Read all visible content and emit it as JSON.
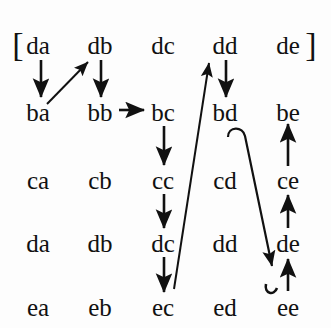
{
  "figure": {
    "background_color": "#fdfdfd",
    "ink_color": "#111111",
    "bracket_open": "[",
    "bracket_close": "]",
    "rows": [
      {
        "row_id": "d-top",
        "cells": [
          "da",
          "db",
          "dc",
          "dd",
          "de"
        ]
      },
      {
        "row_id": "b",
        "cells": [
          "ba",
          "bb",
          "bc",
          "bd",
          "be"
        ]
      },
      {
        "row_id": "c",
        "cells": [
          "ca",
          "cb",
          "cc",
          "cd",
          "ce"
        ]
      },
      {
        "row_id": "d-lower",
        "cells": [
          "da",
          "db",
          "dc",
          "dd",
          "de"
        ]
      },
      {
        "row_id": "e",
        "cells": [
          "ea",
          "eb",
          "ec",
          "ed",
          "ee"
        ]
      }
    ],
    "grid": {
      "column_x": [
        38,
        100,
        163,
        225,
        288
      ],
      "row_y": [
        45,
        112,
        180,
        243,
        307
      ]
    },
    "edges": [
      {
        "name": "da-to-ba",
        "from": "da",
        "to": "ba",
        "style": "straight-down-arrow"
      },
      {
        "name": "ba-to-db",
        "from": "ba",
        "to": "db",
        "style": "diagonal-up-right-arrow"
      },
      {
        "name": "db-to-bb",
        "from": "db",
        "to": "bb",
        "style": "straight-down-arrow"
      },
      {
        "name": "bb-to-bc",
        "from": "bb",
        "to": "bc",
        "style": "horizontal-right-arrow"
      },
      {
        "name": "bc-to-cc",
        "from": "bc",
        "to": "cc",
        "style": "straight-down-arrow"
      },
      {
        "name": "cc-to-dc",
        "from": "cc",
        "to": "dc",
        "style": "straight-down-arrow"
      },
      {
        "name": "dc-to-ec",
        "from": "dc",
        "to": "ec",
        "style": "straight-down-arrow"
      },
      {
        "name": "ec-to-dd",
        "from": "ec",
        "to": "dd",
        "style": "long-diagonal-up-right-arrow"
      },
      {
        "name": "dd-to-bd",
        "from": "dd",
        "to": "bd",
        "style": "straight-down-arrow"
      },
      {
        "name": "bd-to-ee",
        "from": "bd",
        "to": "ee",
        "style": "hooked-diagonal-down-right-arrow"
      },
      {
        "name": "ee-to-de",
        "from": "ee",
        "to": "de",
        "style": "straight-up-arrow"
      },
      {
        "name": "de-to-ce",
        "from": "de",
        "to": "ce",
        "style": "straight-up-arrow"
      },
      {
        "name": "ce-to-be",
        "from": "ce",
        "to": "be",
        "style": "straight-up-arrow"
      }
    ]
  }
}
